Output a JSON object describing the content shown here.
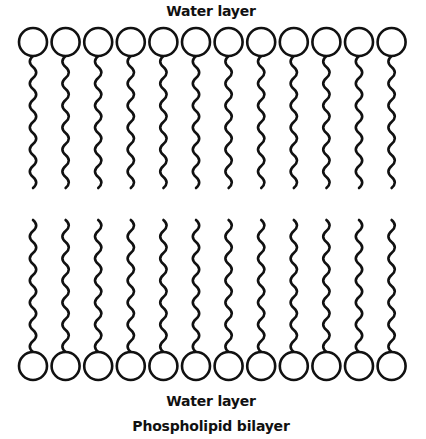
{
  "title": "Phospholipid bilayer",
  "labels": {
    "top": "Water layer",
    "bottom": "Water layer",
    "caption": "Phospholipid bilayer"
  },
  "diagram": {
    "type": "phospholipid-bilayer",
    "molecules_per_leaflet": 12,
    "leaflets": [
      "outer",
      "inner"
    ],
    "head_shape": "circle",
    "tail_shape": "wavy-line",
    "stroke_color": "#111111",
    "background_color": "#ffffff"
  }
}
